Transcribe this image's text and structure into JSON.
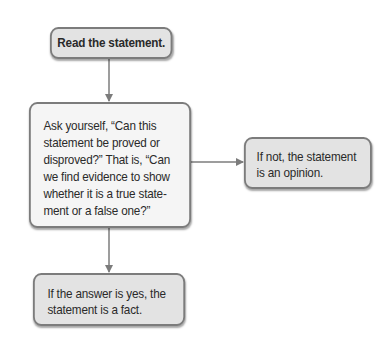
{
  "diagram": {
    "type": "flowchart",
    "colors": {
      "border": "#7c7c7c",
      "box_fill_gray": "#e3e3e3",
      "box_fill_light": "#f5f5f5",
      "arrow": "#7c7c7c",
      "text": "#2a2a2a"
    },
    "nodes": [
      {
        "id": "read",
        "text": "Read the statement."
      },
      {
        "id": "ask",
        "lines": [
          "Ask yourself, “Can this",
          "statement be proved or",
          "disproved?” That is, “Can",
          "we find evidence to show",
          "whether it is a true state-",
          "ment or a false one?”"
        ]
      },
      {
        "id": "opinion",
        "lines": [
          "If not, the statement",
          "is an opinion."
        ]
      },
      {
        "id": "fact",
        "lines": [
          "If the answer is yes, the",
          "statement is a fact."
        ]
      }
    ],
    "edges": [
      {
        "from": "read",
        "to": "ask"
      },
      {
        "from": "ask",
        "to": "opinion",
        "label": ""
      },
      {
        "from": "ask",
        "to": "fact",
        "label": ""
      }
    ]
  }
}
